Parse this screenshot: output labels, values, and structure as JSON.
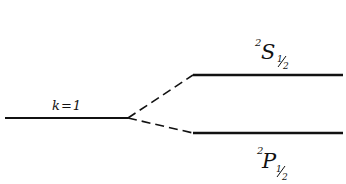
{
  "diagram": {
    "type": "energy-level-splitting",
    "initial_level": {
      "label": "k = 1",
      "label_k": "k",
      "label_eq": "=",
      "label_val": "1"
    },
    "upper_level": {
      "superscript": "2",
      "term": "S",
      "subscript": "1/2",
      "sub_num": "1",
      "sub_den": "2"
    },
    "lower_level": {
      "superscript": "2",
      "term": "P",
      "subscript": "1/2",
      "sub_num": "1",
      "sub_den": "2"
    },
    "line_color": "#111111",
    "background": "#ffffff"
  }
}
